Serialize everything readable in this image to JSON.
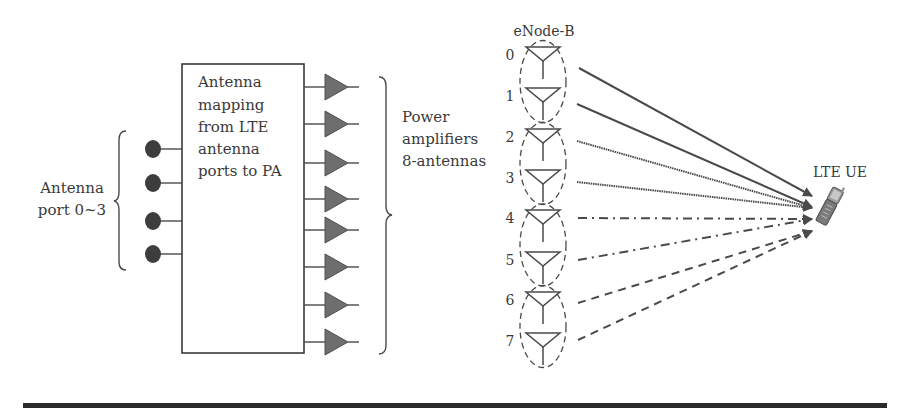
{
  "left_block": {
    "antenna_port_label": [
      "Antenna",
      "port 0~3"
    ],
    "ports": [
      149,
      183,
      221,
      254
    ],
    "mapping_box": {
      "label": [
        "Antenna",
        "mapping",
        "from LTE",
        "antenna",
        "ports to PA"
      ],
      "x": 182,
      "y": 64,
      "w": 122,
      "h": 289
    },
    "pa_rows": [
      87,
      124,
      163,
      199,
      230,
      267,
      305,
      342
    ],
    "pa_label": [
      "Power",
      "amplifiers",
      "8-antennas"
    ]
  },
  "enodeb": {
    "title": "eNode-B",
    "antenna_indices": [
      "0",
      "1",
      "2",
      "3",
      "4",
      "5",
      "6",
      "7"
    ],
    "antenna_y": [
      55,
      96,
      137,
      178,
      218,
      260,
      300,
      341
    ],
    "groups": 4
  },
  "ue": {
    "label": "LTE UE"
  },
  "links": [
    {
      "from": 0,
      "style": "solid"
    },
    {
      "from": 1,
      "style": "solid"
    },
    {
      "from": 2,
      "style": "dotted"
    },
    {
      "from": 3,
      "style": "dotted"
    },
    {
      "from": 4,
      "style": "dash-dot"
    },
    {
      "from": 5,
      "style": "dash-dot"
    },
    {
      "from": 6,
      "style": "dashed"
    },
    {
      "from": 7,
      "style": "dashed"
    }
  ],
  "colors": {
    "line": "#4a4a4a",
    "pa_fill": "#6e6e6e",
    "port_fill": "#3d3d3d",
    "text": "#3a3a3a",
    "rule": "#2a2a2a"
  }
}
